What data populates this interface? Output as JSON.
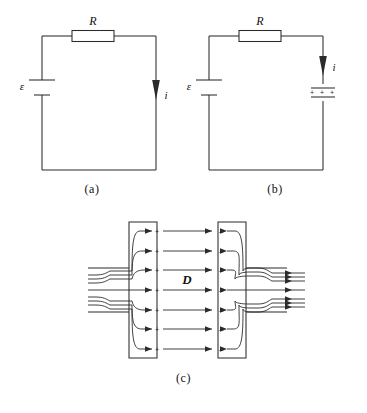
{
  "figure": {
    "panels": [
      {
        "id": "a",
        "caption": "(a)",
        "description": "Simple resistive circuit: emf source in series with resistor R, conduction current i flows.",
        "labels": {
          "resistor": "R",
          "emf": "ε",
          "current": "i"
        },
        "components": [
          "battery",
          "resistor",
          "wire-loop",
          "current-arrow"
        ]
      },
      {
        "id": "b",
        "caption": "(b)",
        "description": "Circuit with emf source, resistor R and a charging parallel-plate capacitor carrying charge; current i flows into the capacitor.",
        "labels": {
          "resistor": "R",
          "emf": "ε",
          "current": "i",
          "capacitor_charge": "+ + +"
        },
        "components": [
          "battery",
          "resistor",
          "capacitor",
          "wire-loop",
          "current-arrow"
        ]
      },
      {
        "id": "c",
        "caption": "(c)",
        "description": "Close-up of the capacitor gap: conduction current lines converge on the positive plate, the displacement field D crosses the gap, and lines leave the negative plate.",
        "labels": {
          "displacement_field": "D",
          "positive_plate_sign": "+",
          "negative_plate_sign": "–"
        },
        "field_line_count": 7,
        "lead_wire_count": 7,
        "components": [
          "left-plate",
          "right-plate",
          "displacement-field-lines",
          "incoming-leads",
          "outgoing-leads"
        ]
      }
    ],
    "colors": {
      "ink": "#2b2b2b",
      "background": "#ffffff",
      "text": "#111111"
    }
  }
}
